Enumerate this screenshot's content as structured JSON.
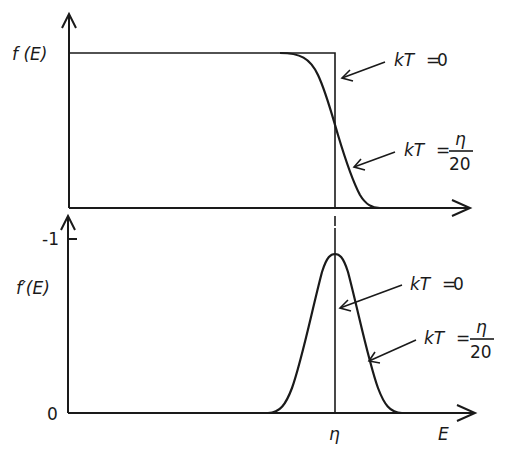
{
  "top_panel": {
    "y_label": "f (E)",
    "annotations": [
      {
        "kt_label": "kT",
        "eq": "=",
        "value": "0"
      },
      {
        "kt_label": "kT",
        "eq": "=",
        "numerator": "η",
        "denominator": "20"
      }
    ]
  },
  "bottom_panel": {
    "y_label": "f′(E)",
    "y_tick_top": "-1",
    "y_tick_bottom": "0",
    "x_tick": "η",
    "x_label": "E",
    "annotations": [
      {
        "kt_label": "kT",
        "eq": "=",
        "value": "0"
      },
      {
        "kt_label": "kT",
        "eq": "=",
        "numerator": "η",
        "denominator": "20"
      }
    ]
  },
  "colors": {
    "ink": "#1a1a1a",
    "background": "#ffffff"
  }
}
